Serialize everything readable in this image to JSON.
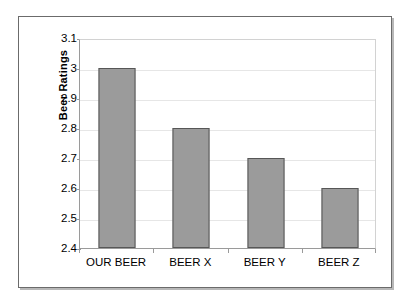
{
  "chart_data": {
    "type": "bar",
    "title": "",
    "subtitle": "",
    "xlabel": "",
    "ylabel": "Beer Ratings",
    "categories": [
      "OUR BEER",
      "BEER X",
      "BEER Y",
      "BEER Z"
    ],
    "values": [
      3.0,
      2.8,
      2.7,
      2.6
    ],
    "value_labels": [
      "3",
      "2.8",
      "2.7",
      "2.6"
    ],
    "ylim": [
      2.4,
      3.1
    ],
    "ytick_step": 0.1,
    "ytick_labels": [
      "3.1",
      "3",
      "2.9",
      "2.8",
      "2.7",
      "2.6",
      "2.5",
      "2.4"
    ],
    "ytick_values": [
      3.1,
      3.0,
      2.9,
      2.8,
      2.7,
      2.6,
      2.5,
      2.4
    ],
    "grid": true,
    "grid_axis": "y",
    "legend": false,
    "legend_position": "none",
    "series": [
      {
        "name": "Beer Ratings",
        "values": [
          3.0,
          2.8,
          2.7,
          2.6
        ]
      }
    ],
    "colors": {
      "bar_fill": "#9b9b9b",
      "bar_border": "#575757",
      "gridline": "#e6e6e6",
      "axis_line": "#9a9a9a",
      "plot_border": "#d2d2d2",
      "frame_border": "#6b6b6b",
      "frame_shadow": "#b8b8b8",
      "background": "#ffffff",
      "text": "#000000"
    }
  }
}
